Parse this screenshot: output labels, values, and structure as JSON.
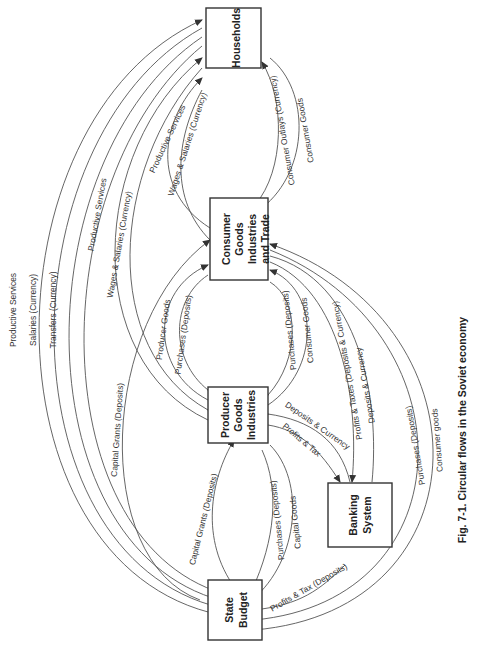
{
  "diagram": {
    "caption": "Fig. 7-1. Circular flows in the Soviet economy",
    "orientation": "rotated 90 degrees counter-clockwise",
    "nodes": {
      "households": {
        "label_1": "Households"
      },
      "consumer_goods": {
        "label_1": "Consumer",
        "label_2": "Goods",
        "label_3": "Industries",
        "label_4": "and Trade"
      },
      "producer_goods": {
        "label_1": "Producer",
        "label_2": "Goods",
        "label_3": "Industries"
      },
      "state_budget": {
        "label_1": "State",
        "label_2": "Budget"
      },
      "banking_system": {
        "label_1": "Banking",
        "label_2": "System"
      }
    },
    "flows": {
      "hh_to_sb_services": "Productive Services",
      "sb_to_hh_salaries": "Salaries (Currency)",
      "sb_to_hh_transfers": "Transfers (Currency)",
      "hh_to_pg_services": "Productive Services",
      "pg_to_hh_wages": "Wages & Salaries (Currency)",
      "hh_to_cg_services": "Productive Services",
      "cg_to_hh_wages": "Wages & Salaries (Currency)",
      "hh_to_cg_outlays": "Consumer Outlays (Currency)",
      "cg_to_hh_goods": "Consumer Goods",
      "sb_to_cg_grants": "Capital Grants (Deposits)",
      "pg_to_cg_goods": "Producer Goods",
      "cg_to_pg_purchases": "Purchases (Deposits)",
      "pg_to_cg_purchases": "Purchases (Deposits)",
      "cg_to_pg_goods": "Consumer Goods",
      "cg_to_bank_taxes": "Profits & Taxes (Deposits & Currency)",
      "cg_to_bank_deposits": "Deposits & Currency",
      "pg_to_bank_tax": "Profits & Tax",
      "pg_to_bank_deposits": "Deposits & Currency",
      "sb_to_pg_grants": "Capital Grants (Deposits)",
      "pg_to_sb_purchases": "Purchases (Deposits)",
      "pg_to_sb_capital": "Capital Goods",
      "bank_to_sb_tax": "Profits & Tax (Deposits)",
      "sb_to_cg_purchases": "Purchases (Deposits)",
      "cg_to_sb_goods": "Consumer goods"
    }
  }
}
